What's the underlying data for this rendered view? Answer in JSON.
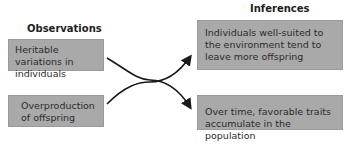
{
  "observations": {
    "header": "Observations",
    "items": [
      {
        "text": "Heritable variations in individuals"
      },
      {
        "text": "Overproduction of offspring"
      }
    ]
  },
  "inferences": {
    "header": "Inferences",
    "items": [
      {
        "text": "Individuals well-suited to the environment tend to leave more offspring"
      },
      {
        "text": "Over time, favorable traits accumulate in the population"
      }
    ]
  },
  "colors": {
    "box_fill": "#a9a9a9",
    "arrow": "#1a1a1a",
    "text": "#2b2b2b"
  }
}
